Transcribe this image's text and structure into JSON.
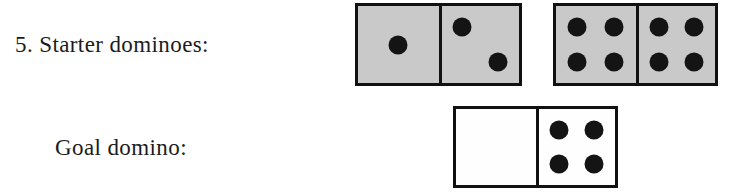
{
  "problem": {
    "number": "5.",
    "starter_label": "5. Starter dominoes:",
    "goal_label": "Goal domino:"
  },
  "colors": {
    "page_background": "#ffffff",
    "domino_tile_fill": "#c9c9c9",
    "domino_blank_fill": "#fefefe",
    "domino_border": "#111111",
    "pip_color": "#141414",
    "text_color": "#1b1b1b"
  },
  "starter_dominoes": [
    {
      "name": "starter-domino-1",
      "fill": "shaded",
      "left_value": 1,
      "right_value": 2,
      "left_pips": [
        "center"
      ],
      "right_pips": [
        "top-left",
        "bottom-right"
      ],
      "notation": "1|2"
    },
    {
      "name": "starter-domino-2",
      "fill": "shaded",
      "left_value": 4,
      "right_value": 4,
      "left_pips": [
        "top-left",
        "top-right",
        "bottom-left",
        "bottom-right"
      ],
      "right_pips": [
        "top-left",
        "top-right",
        "bottom-left",
        "bottom-right"
      ],
      "notation": "4|4"
    }
  ],
  "goal_domino": {
    "name": "goal-domino",
    "fill": "blank",
    "left_value": 0,
    "right_value": 4,
    "left_pips": [],
    "right_pips": [
      "top-left",
      "top-right",
      "bottom-left",
      "bottom-right"
    ],
    "notation": "0|4"
  }
}
